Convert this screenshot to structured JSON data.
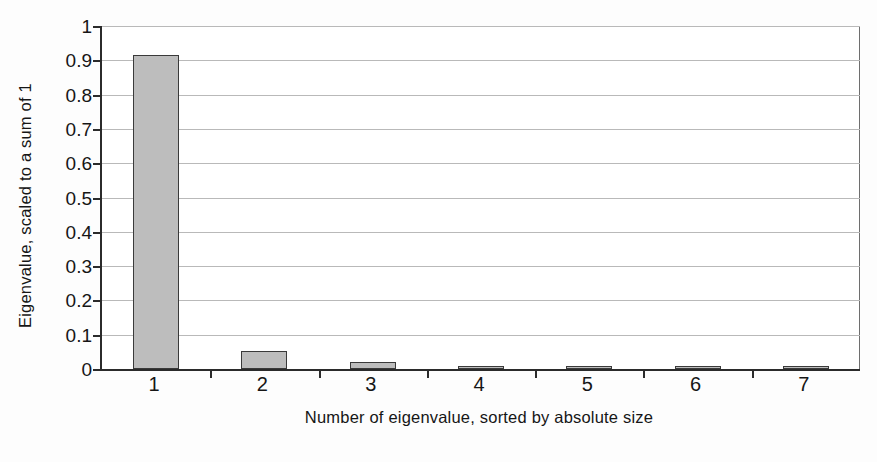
{
  "chart_data": {
    "type": "bar",
    "title": "",
    "xlabel": "Number of eigenvalue, sorted by absolute size",
    "ylabel": "Eigenvalue, scaled to a sum of 1",
    "categories": [
      "1",
      "2",
      "3",
      "4",
      "5",
      "6",
      "7"
    ],
    "values": [
      0.915,
      0.052,
      0.021,
      0.008,
      0.003,
      0.002,
      0.002
    ],
    "ylim": [
      0,
      1
    ],
    "ytick_labels": [
      "0",
      "0.1",
      "0.2",
      "0.3",
      "0.4",
      "0.5",
      "0.6",
      "0.7",
      "0.8",
      "0.9",
      "1"
    ],
    "ytick_values": [
      0,
      0.1,
      0.2,
      0.3,
      0.4,
      0.5,
      0.6,
      0.7,
      0.8,
      0.9,
      1
    ],
    "grid": true,
    "legend": "none",
    "series": [
      {
        "name": "Eigenvalue, scaled to a sum of 1",
        "values": [
          0.915,
          0.052,
          0.021,
          0.008,
          0.003,
          0.002,
          0.002
        ]
      }
    ],
    "colors": {
      "bar_fill": "#bdbdbd",
      "bar_edge": "#3a3a3a",
      "gridline": "#b9b9b9",
      "axis": "#2b2b2b",
      "background": "#ffffff",
      "text": "#161616"
    }
  }
}
